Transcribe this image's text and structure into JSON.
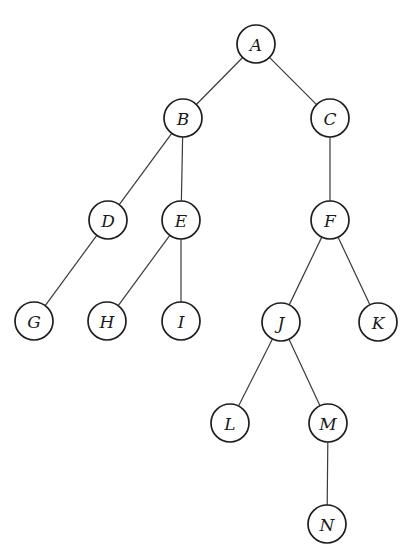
{
  "diagram": {
    "type": "tree",
    "node_radius": 19,
    "colors": {
      "background": "#ffffff",
      "node_stroke": "#1e1e1e",
      "edge_stroke": "#3a3a3a",
      "label": "#1a1a1a"
    },
    "nodes": [
      {
        "id": "A",
        "label": "A",
        "x": 256,
        "y": 44
      },
      {
        "id": "B",
        "label": "B",
        "x": 183,
        "y": 118
      },
      {
        "id": "C",
        "label": "C",
        "x": 330,
        "y": 118
      },
      {
        "id": "D",
        "label": "D",
        "x": 108,
        "y": 220
      },
      {
        "id": "E",
        "label": "E",
        "x": 181,
        "y": 220
      },
      {
        "id": "F",
        "label": "F",
        "x": 330,
        "y": 220
      },
      {
        "id": "G",
        "label": "G",
        "x": 34,
        "y": 321
      },
      {
        "id": "H",
        "label": "H",
        "x": 107,
        "y": 321
      },
      {
        "id": "I",
        "label": "I",
        "x": 181,
        "y": 321
      },
      {
        "id": "J",
        "label": "J",
        "x": 281,
        "y": 322
      },
      {
        "id": "K",
        "label": "K",
        "x": 378,
        "y": 322
      },
      {
        "id": "L",
        "label": "L",
        "x": 230,
        "y": 423
      },
      {
        "id": "M",
        "label": "M",
        "x": 328,
        "y": 423
      },
      {
        "id": "N",
        "label": "N",
        "x": 327,
        "y": 524
      }
    ],
    "edges": [
      {
        "from": "A",
        "to": "B"
      },
      {
        "from": "A",
        "to": "C"
      },
      {
        "from": "B",
        "to": "D"
      },
      {
        "from": "B",
        "to": "E"
      },
      {
        "from": "C",
        "to": "F"
      },
      {
        "from": "D",
        "to": "G"
      },
      {
        "from": "E",
        "to": "H"
      },
      {
        "from": "E",
        "to": "I"
      },
      {
        "from": "F",
        "to": "J"
      },
      {
        "from": "F",
        "to": "K"
      },
      {
        "from": "J",
        "to": "L"
      },
      {
        "from": "J",
        "to": "M"
      },
      {
        "from": "M",
        "to": "N"
      }
    ]
  }
}
